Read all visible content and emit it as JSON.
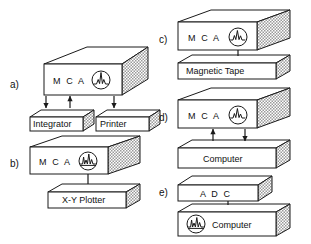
{
  "figure": {
    "background_color": "#ffffff",
    "line_color": "#1a1a1a",
    "hatch_color": "#9a9a9a",
    "style": "line-art isometric block diagram"
  },
  "panels": [
    {
      "id": "a",
      "letter": "a)",
      "blocks": [
        {
          "name": "mca",
          "label": "M C A",
          "icon": "spectrum-scope-icon",
          "icon_side": "right"
        },
        {
          "name": "integrator",
          "label": "Integrator",
          "icon": null
        },
        {
          "name": "printer",
          "label": "Printer",
          "icon": null
        }
      ],
      "connections": [
        {
          "from": "mca",
          "to": "integrator",
          "arrow": "down"
        },
        {
          "from": "integrator",
          "to": "mca",
          "arrow": "up"
        },
        {
          "from": "mca",
          "to": "printer",
          "arrow": "down"
        }
      ]
    },
    {
      "id": "b",
      "letter": "b)",
      "blocks": [
        {
          "name": "mca",
          "label": "M C A",
          "icon": "spectrum-scope-icon",
          "icon_side": "right"
        },
        {
          "name": "xy-plotter",
          "label": "X-Y Plotter",
          "icon": null
        }
      ],
      "connections": [
        {
          "from": "mca",
          "to": "xy-plotter",
          "arrow": "none"
        }
      ]
    },
    {
      "id": "c",
      "letter": "c)",
      "blocks": [
        {
          "name": "mca",
          "label": "M C A",
          "icon": "spectrum-scope-icon",
          "icon_side": "right"
        },
        {
          "name": "magnetic-tape",
          "label": "Magnetic Tape",
          "icon": null
        }
      ],
      "connections": [
        {
          "from": "mca",
          "to": "magnetic-tape",
          "arrow": "none"
        }
      ]
    },
    {
      "id": "d",
      "letter": "d)",
      "blocks": [
        {
          "name": "mca",
          "label": "M C A",
          "icon": "spectrum-scope-icon",
          "icon_side": "right"
        },
        {
          "name": "computer",
          "label": "Computer",
          "icon": null
        }
      ],
      "connections": [
        {
          "from": "computer",
          "to": "mca",
          "arrow": "up"
        },
        {
          "from": "mca",
          "to": "computer",
          "arrow": "down"
        }
      ]
    },
    {
      "id": "e",
      "letter": "e)",
      "blocks": [
        {
          "name": "adc",
          "label": "A D C",
          "icon": null
        },
        {
          "name": "computer",
          "label": "Computer",
          "icon": "spectrum-scope-icon",
          "icon_side": "left"
        }
      ],
      "connections": [
        {
          "from": "adc",
          "to": "computer",
          "arrow": "none"
        }
      ]
    }
  ]
}
